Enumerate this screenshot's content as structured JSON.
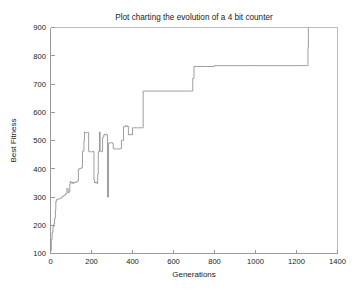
{
  "figure": {
    "background_color": "#ffffff",
    "width": 362,
    "height": 296
  },
  "chart_data": {
    "type": "line",
    "title": "Plot charting the evolution of a 4 bit counter",
    "xlabel": "Generations",
    "ylabel": "Best Fitness",
    "xlim": [
      0,
      1400
    ],
    "ylim": [
      100,
      900
    ],
    "xticks": [
      0,
      200,
      400,
      600,
      800,
      1000,
      1200,
      1400
    ],
    "yticks": [
      100,
      200,
      300,
      400,
      500,
      600,
      700,
      800,
      900
    ],
    "xtick_labels": [
      "0",
      "200",
      "400",
      "600",
      "800",
      "1000",
      "1200",
      "1400"
    ],
    "ytick_labels": [
      "100",
      "200",
      "300",
      "400",
      "500",
      "600",
      "700",
      "800",
      "900"
    ],
    "grid": false,
    "legend": null,
    "legend_position": "none",
    "line_color": "#8c8c8c",
    "series": [
      {
        "name": "Best Fitness",
        "x": [
          0,
          4,
          8,
          12,
          16,
          20,
          24,
          26,
          30,
          34,
          38,
          42,
          46,
          50,
          54,
          58,
          60,
          64,
          68,
          70,
          74,
          78,
          80,
          84,
          86,
          90,
          94,
          96,
          100,
          104,
          108,
          112,
          116,
          120,
          124,
          128,
          132,
          136,
          140,
          144,
          148,
          152,
          156,
          158,
          160,
          163,
          166,
          170,
          174,
          178,
          182,
          186,
          190,
          194,
          198,
          200,
          203,
          206,
          209,
          212,
          215,
          218,
          221,
          224,
          227,
          230,
          233,
          236,
          239,
          242,
          245,
          248,
          251,
          254,
          257,
          260,
          263,
          266,
          269,
          272,
          275,
          278,
          280,
          283,
          286,
          290,
          294,
          298,
          302,
          306,
          310,
          316,
          322,
          328,
          334,
          340,
          346,
          352,
          356,
          360,
          364,
          368,
          372,
          376,
          380,
          384,
          388,
          392,
          396,
          400,
          406,
          412,
          418,
          424,
          430,
          436,
          442,
          448,
          452,
          520,
          600,
          660,
          688,
          690,
          694,
          700,
          760,
          800,
          900,
          1000,
          1100,
          1200,
          1250,
          1254,
          1256,
          1258
        ],
        "y": [
          110,
          150,
          175,
          195,
          205,
          225,
          255,
          285,
          292,
          292,
          293,
          293,
          295,
          296,
          300,
          300,
          302,
          305,
          305,
          308,
          312,
          312,
          330,
          330,
          315,
          318,
          345,
          355,
          350,
          352,
          348,
          352,
          350,
          353,
          352,
          355,
          357,
          398,
          400,
          400,
          402,
          405,
          462,
          462,
          462,
          500,
          530,
          528,
          528,
          528,
          528,
          462,
          460,
          460,
          460,
          460,
          460,
          462,
          462,
          360,
          350,
          352,
          350,
          352,
          348,
          380,
          460,
          462,
          530,
          462,
          460,
          460,
          462,
          510,
          512,
          520,
          522,
          520,
          520,
          522,
          520,
          300,
          300,
          490,
          492,
          492,
          492,
          492,
          490,
          472,
          470,
          470,
          470,
          470,
          470,
          472,
          500,
          500,
          548,
          550,
          552,
          550,
          552,
          550,
          520,
          520,
          522,
          522,
          520,
          545,
          545,
          545,
          545,
          545,
          545,
          545,
          545,
          545,
          675,
          675,
          675,
          675,
          675,
          675,
          720,
          762,
          762,
          765,
          765,
          765,
          765,
          765,
          765,
          765,
          830,
          900
        ]
      }
    ],
    "annotations": [
      {
        "text": "step up to ~675 at generation ~450"
      },
      {
        "text": "step up to ~765 at generation ~690"
      },
      {
        "text": "final rise to 900 at generation ~1255"
      }
    ]
  }
}
